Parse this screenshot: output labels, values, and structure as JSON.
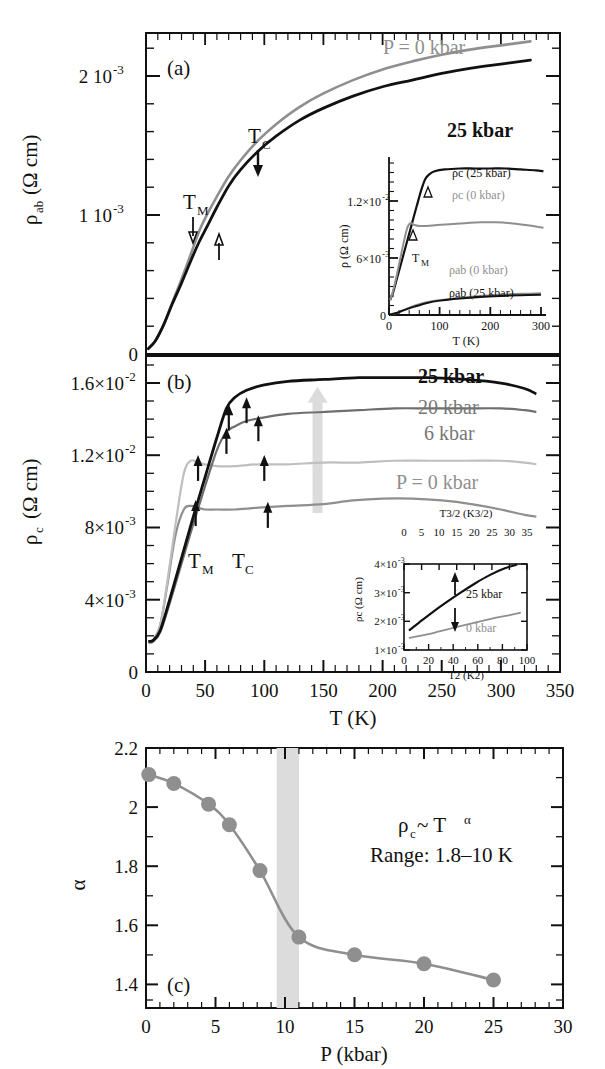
{
  "figure": {
    "background": "#ffffff",
    "colors": {
      "black": "#111111",
      "dark_gray": "#6e6e6e",
      "gray": "#8f8f8f",
      "mid_gray": "#9a9a9a",
      "light_gray": "#bfbfbf",
      "band_gray": "#dcdcdc"
    }
  },
  "panel_a": {
    "id": "(a)",
    "xlabel": "",
    "ylabel": "ρab (Ω cm)",
    "ylabel_base": "ρ",
    "ylabel_sub": "ab",
    "ylabel_unit": "(Ω cm)",
    "ytick_labels": [
      "0",
      "1 10",
      "2 10"
    ],
    "ytick_exponents": [
      "",
      "-3",
      "-3"
    ],
    "ytick_values": [
      0,
      0.001,
      0.002
    ],
    "annotations": {
      "p0": "P = 0 kbar",
      "p25": "25 kbar",
      "tc": "T",
      "tc_sub": "C",
      "tm": "T",
      "tm_sub": "M"
    },
    "chart_data": {
      "type": "line",
      "title": "(a) rho_ab vs T",
      "xlabel": "T (K)",
      "ylabel": "ρab (Ω cm)",
      "xlim": [
        0,
        350
      ],
      "ylim": [
        0,
        0.00235
      ],
      "grid": false,
      "series": [
        {
          "name": "P = 0 kbar",
          "color": "#8f8f8f",
          "x": [
            2,
            8,
            15,
            22,
            30,
            38,
            45,
            52,
            60,
            70,
            80,
            95,
            110,
            130,
            150,
            175,
            200,
            225,
            250,
            275,
            300,
            325
          ],
          "y": [
            4e-05,
            0.0001,
            0.00022,
            0.00038,
            0.00056,
            0.00075,
            0.00092,
            0.00105,
            0.00118,
            0.00133,
            0.00145,
            0.0016,
            0.00172,
            0.00185,
            0.00195,
            0.00205,
            0.00213,
            0.00219,
            0.00224,
            0.00228,
            0.00231,
            0.00234
          ]
        },
        {
          "name": "25 kbar",
          "color": "#111111",
          "x": [
            2,
            8,
            15,
            22,
            30,
            38,
            45,
            52,
            60,
            70,
            80,
            95,
            110,
            130,
            150,
            175,
            200,
            225,
            250,
            275,
            300,
            325
          ],
          "y": [
            4e-05,
            0.0001,
            0.00022,
            0.00037,
            0.00053,
            0.0007,
            0.00084,
            0.00096,
            0.0011,
            0.00126,
            0.00138,
            0.00152,
            0.00163,
            0.00175,
            0.00184,
            0.00193,
            0.002,
            0.00205,
            0.0021,
            0.00214,
            0.00217,
            0.0022
          ]
        }
      ],
      "markers": [
        {
          "label": "T_C",
          "x": 105,
          "direction": "down",
          "color": "#111111"
        },
        {
          "label": "T_M",
          "x": 47,
          "direction": "down",
          "color": "#111111"
        },
        {
          "label": "T_M",
          "x": 62,
          "direction": "up",
          "color": "#111111"
        }
      ]
    },
    "inset": {
      "xlabel": "T (K)",
      "ylabel": "ρ (Ω cm)",
      "xtick_labels": [
        "0",
        "100",
        "200",
        "300"
      ],
      "ytick_labels": [
        "0",
        "6×10",
        "1.2×10"
      ],
      "ytick_exponents": [
        "",
        "-3",
        "-2"
      ],
      "curve_labels": [
        "ρc (25 kbar)",
        "ρc (0 kbar)",
        "ρab (0 kbar)",
        "ρab (25 kbar)"
      ],
      "tm_label": "T",
      "tm_sub": "M",
      "chart_data": {
        "type": "line",
        "title": "inset (a): rho vs T full scale",
        "xlabel": "T (K)",
        "ylabel": "ρ (Ω cm)",
        "xlim": [
          0,
          310
        ],
        "ylim": [
          0,
          0.0165
        ],
        "grid": false,
        "series": [
          {
            "name": "ρc (25 kbar)",
            "color": "#111111",
            "x": [
              2,
              8,
              15,
              25,
              35,
              45,
              55,
              65,
              72,
              80,
              90,
              110,
              140,
              170,
              200,
              230,
              260,
              290,
              305
            ],
            "y": [
              0.0016,
              0.0024,
              0.0038,
              0.0058,
              0.0078,
              0.0098,
              0.0118,
              0.0137,
              0.0147,
              0.0152,
              0.0155,
              0.0157,
              0.0158,
              0.0158,
              0.0158,
              0.0158,
              0.0157,
              0.0156,
              0.0155
            ]
          },
          {
            "name": "ρc (0 kbar)",
            "color": "#8f8f8f",
            "x": [
              2,
              8,
              15,
              25,
              35,
              42,
              50,
              60,
              75,
              95,
              120,
              150,
              180,
              210,
              240,
              270,
              295,
              305
            ],
            "y": [
              0.0016,
              0.0026,
              0.0042,
              0.0068,
              0.0092,
              0.0099,
              0.0097,
              0.0096,
              0.0096,
              0.0097,
              0.0098,
              0.0099,
              0.01,
              0.01,
              0.0099,
              0.0097,
              0.0095,
              0.0094
            ]
          },
          {
            "name": "ρab (0 kbar)",
            "color": "#8f8f8f",
            "x": [
              2,
              15,
              30,
              50,
              75,
              100,
              140,
              180,
              220,
              260,
              300
            ],
            "y": [
              5e-05,
              0.00022,
              0.00056,
              0.001,
              0.00138,
              0.0016,
              0.00186,
              0.00205,
              0.00219,
              0.00228,
              0.00234
            ]
          },
          {
            "name": "ρab (25 kbar)",
            "color": "#111111",
            "x": [
              2,
              15,
              30,
              50,
              75,
              100,
              140,
              180,
              220,
              260,
              300
            ],
            "y": [
              5e-05,
              0.00022,
              0.00053,
              0.0009,
              0.0013,
              0.00155,
              0.00178,
              0.00195,
              0.00206,
              0.00214,
              0.00219
            ]
          }
        ],
        "markers": [
          {
            "label": "T_M",
            "x": 72,
            "direction": "up",
            "color": "#111111"
          },
          {
            "label": "T_M",
            "x": 40,
            "direction": "up",
            "color": "#111111"
          }
        ]
      }
    }
  },
  "panel_b": {
    "id": "(b)",
    "xlabel": "T (K)",
    "ylabel_base": "ρ",
    "ylabel_sub": "c",
    "ylabel_unit": "(Ω cm)",
    "xtick_labels": [
      "0",
      "50",
      "100",
      "150",
      "200",
      "250",
      "300",
      "350"
    ],
    "ytick_labels": [
      "0",
      "4×10",
      "8×10",
      "1.2×10",
      "1.6×10"
    ],
    "ytick_exponents": [
      "",
      "-3",
      "-3",
      "-2",
      "-2"
    ],
    "ytick_values": [
      0,
      0.004,
      0.008,
      0.012,
      0.016
    ],
    "annotations": {
      "p25": "25 kbar",
      "p20": "20 kbar",
      "p6": "6 kbar",
      "p0": "P = 0 kbar",
      "tm": "T",
      "tm_sub": "M",
      "tc": "T",
      "tc_sub": "C"
    },
    "chart_data": {
      "type": "line",
      "title": "(b) rho_c vs T at several pressures",
      "xlabel": "T (K)",
      "ylabel": "ρc (Ω cm)",
      "xlim": [
        0,
        350
      ],
      "ylim": [
        0,
        0.0175
      ],
      "grid": false,
      "series": [
        {
          "name": "25 kbar",
          "color": "#111111",
          "x": [
            2,
            6,
            12,
            20,
            30,
            40,
            50,
            60,
            68,
            75,
            85,
            100,
            120,
            150,
            180,
            210,
            240,
            270,
            300,
            320,
            330
          ],
          "y": [
            0.0017,
            0.00175,
            0.0023,
            0.004,
            0.0063,
            0.0086,
            0.0108,
            0.013,
            0.0146,
            0.0152,
            0.0156,
            0.0159,
            0.0161,
            0.0162,
            0.0163,
            0.0163,
            0.0163,
            0.0162,
            0.016,
            0.0157,
            0.0154
          ]
        },
        {
          "name": "20 kbar",
          "color": "#6e6e6e",
          "x": [
            2,
            6,
            12,
            20,
            30,
            40,
            50,
            60,
            68,
            75,
            85,
            100,
            120,
            150,
            180,
            210,
            240,
            270,
            300,
            320,
            330
          ],
          "y": [
            0.00165,
            0.0017,
            0.0022,
            0.0038,
            0.006,
            0.0082,
            0.0103,
            0.0123,
            0.0133,
            0.0136,
            0.0139,
            0.0141,
            0.0143,
            0.0144,
            0.0145,
            0.0146,
            0.0146,
            0.0146,
            0.0146,
            0.0145,
            0.0144
          ]
        },
        {
          "name": "6 kbar",
          "color": "#bfbfbf",
          "x": [
            2,
            6,
            12,
            18,
            25,
            32,
            38,
            44,
            50,
            60,
            75,
            95,
            120,
            150,
            180,
            210,
            240,
            270,
            300,
            320,
            330
          ],
          "y": [
            0.0016,
            0.0017,
            0.0026,
            0.005,
            0.0082,
            0.011,
            0.0117,
            0.0116,
            0.0115,
            0.0114,
            0.0114,
            0.0115,
            0.0115,
            0.0116,
            0.0116,
            0.0117,
            0.0117,
            0.0117,
            0.0117,
            0.0116,
            0.0115
          ]
        },
        {
          "name": "P = 0 kbar",
          "color": "#8f8f8f",
          "x": [
            2,
            6,
            12,
            18,
            25,
            32,
            38,
            44,
            50,
            60,
            75,
            95,
            120,
            150,
            175,
            200,
            225,
            250,
            275,
            300,
            320,
            330
          ],
          "y": [
            0.00165,
            0.00175,
            0.0026,
            0.0048,
            0.0076,
            0.009,
            0.0092,
            0.0091,
            0.009,
            0.009,
            0.009,
            0.0091,
            0.0092,
            0.0093,
            0.0095,
            0.0096,
            0.0096,
            0.0095,
            0.0093,
            0.009,
            0.0087,
            0.0086
          ]
        }
      ],
      "markers": [
        {
          "label": "T_M",
          "x": 42,
          "y": 0.0093,
          "direction": "up",
          "color": "#111111"
        },
        {
          "label": "T_M",
          "x": 44,
          "y": 0.0118,
          "direction": "up",
          "color": "#111111"
        },
        {
          "label": "T_M",
          "x": 68,
          "y": 0.0133,
          "direction": "up",
          "color": "#111111"
        },
        {
          "label": "T_M",
          "x": 70,
          "y": 0.0146,
          "direction": "up",
          "color": "#111111"
        },
        {
          "label": "T_C",
          "x": 103,
          "y": 0.0092,
          "direction": "up",
          "color": "#111111"
        },
        {
          "label": "T_C",
          "x": 100,
          "y": 0.0118,
          "direction": "up",
          "color": "#111111"
        },
        {
          "label": "T_C",
          "x": 95,
          "y": 0.014,
          "direction": "up",
          "color": "#111111"
        },
        {
          "label": "T_C",
          "x": 85,
          "y": 0.015,
          "direction": "up",
          "color": "#111111"
        }
      ],
      "pressure_arrow": {
        "x": 145,
        "from_y": 0.0088,
        "to_y": 0.0158,
        "color": "#dcdcdc"
      }
    },
    "inset": {
      "xlabel_bottom": "T",
      "xlabel_bottom_sup": "2",
      "xlabel_bottom_unit": "(K",
      "xlabel_bottom_unit_sup": "2",
      "xlabel_bottom_full": "T2 (K2)",
      "xlabel_top_full": "T3/2 (K3/2)",
      "ylabel_full": "ρc (Ω cm)",
      "xtick_bottom": [
        "0",
        "20",
        "40",
        "60",
        "80",
        "100"
      ],
      "xtick_top": [
        "0",
        "5",
        "10",
        "15",
        "20",
        "25",
        "30",
        "35"
      ],
      "ytick_labels": [
        "1×10",
        "2×10",
        "3×10",
        "4×10"
      ],
      "ytick_exponents": [
        "-3",
        "-3",
        "-3",
        "-3"
      ],
      "curve_labels": [
        "25 kbar",
        "0 kbar"
      ],
      "chart_data": {
        "type": "line",
        "title": "inset (b): rho_c low-T power law",
        "xlabel": "T² (K²)",
        "ylabel": "ρc (Ω cm)",
        "xlim": [
          0,
          100
        ],
        "ylim": [
          0.001,
          0.004
        ],
        "grid": false,
        "series": [
          {
            "name": "25 kbar",
            "color": "#111111",
            "x": [
              4,
              12,
              22,
              34,
              46,
              58,
              70,
              82,
              92
            ],
            "y": [
              0.00168,
              0.00195,
              0.00228,
              0.00265,
              0.003,
              0.00333,
              0.00362,
              0.00385,
              0.00398
            ]
          },
          {
            "name": "0 kbar",
            "color": "#8f8f8f",
            "x": [
              4,
              14,
              26,
              38,
              50,
              62,
              74,
              86,
              95
            ],
            "y": [
              0.00142,
              0.0015,
              0.00162,
              0.00175,
              0.00188,
              0.002,
              0.00212,
              0.00222,
              0.0023
            ]
          }
        ],
        "markers": [
          {
            "label": "25 kbar",
            "x": 42,
            "direction": "up",
            "color": "#111111"
          },
          {
            "label": "0 kbar",
            "x": 42,
            "direction": "down",
            "color": "#111111"
          }
        ]
      }
    }
  },
  "panel_c": {
    "id": "(c)",
    "xlabel": "P (kbar)",
    "ylabel": "α",
    "annotation_1": "ρc ~ Tα",
    "annotation_1_base": "ρ",
    "annotation_1_sub": "c",
    "annotation_1_mid": " ~ T",
    "annotation_1_sup": "α",
    "annotation_2": "Range: 1.8–10 K",
    "xtick_labels": [
      "0",
      "5",
      "10",
      "15",
      "20",
      "25",
      "30"
    ],
    "ytick_labels": [
      "1.4",
      "1.6",
      "1.8",
      "2",
      "2.2"
    ],
    "chart_data": {
      "type": "line",
      "title": "(c) exponent alpha vs pressure",
      "xlabel": "P (kbar)",
      "ylabel": "α",
      "xlim": [
        0,
        30
      ],
      "ylim": [
        1.32,
        2.2
      ],
      "grid": false,
      "marker": "circle",
      "marker_color": "#8f8f8f",
      "line_color": "#8f8f8f",
      "x": [
        0.2,
        2.0,
        4.5,
        6.0,
        8.2,
        11.0,
        15.0,
        20.0,
        25.0
      ],
      "y": [
        2.11,
        2.08,
        2.01,
        1.94,
        1.785,
        1.56,
        1.5,
        1.47,
        1.415
      ],
      "shaded_band": {
        "x_from": 9.4,
        "x_to": 11.0,
        "color": "#dcdcdc"
      }
    }
  }
}
